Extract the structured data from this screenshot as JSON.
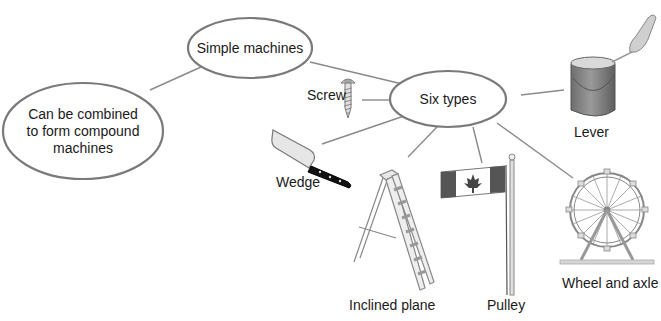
{
  "diagram": {
    "type": "concept-map",
    "colors": {
      "stroke": "#7a7a7a",
      "line": "#8a8a8a",
      "text": "#1a1a1a",
      "background": "#ffffff"
    },
    "nodes": {
      "root": {
        "label": "Simple machines"
      },
      "compound": {
        "lines": [
          "Can be combined",
          "to form compound",
          "machines"
        ]
      },
      "types": {
        "label": "Six types"
      }
    },
    "machines": [
      {
        "id": "lever",
        "label": "Lever",
        "icon": "paint-can-lever-icon"
      },
      {
        "id": "screw",
        "label": "Screw",
        "icon": "screw-icon"
      },
      {
        "id": "wedge",
        "label": "Wedge",
        "icon": "cleaver-knife-icon"
      },
      {
        "id": "inclined-plane",
        "label": "Inclined plane",
        "icon": "step-ladder-icon"
      },
      {
        "id": "pulley",
        "label": "Pulley",
        "icon": "flagpole-icon"
      },
      {
        "id": "wheel-and-axle",
        "label": "Wheel and axle",
        "icon": "ferris-wheel-icon"
      }
    ]
  }
}
